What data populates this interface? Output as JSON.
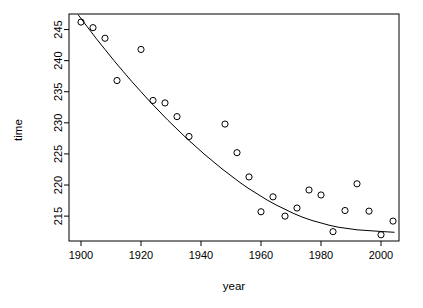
{
  "chart_data": {
    "type": "scatter",
    "title": "",
    "xlabel": "year",
    "ylabel": "time",
    "xlim": [
      1896.0,
      2006.0
    ],
    "ylim": [
      211.0,
      247.5
    ],
    "xticks": [
      1900,
      1920,
      1940,
      1960,
      1980,
      2000
    ],
    "yticks": [
      215,
      220,
      225,
      230,
      235,
      240,
      245
    ],
    "grid": false,
    "legend": null,
    "point_marker": "open-circle",
    "series": [
      {
        "name": "observed",
        "kind": "points",
        "x": [
          1900,
          1904,
          1908,
          1912,
          1920,
          1924,
          1928,
          1932,
          1936,
          1948,
          1952,
          1956,
          1960,
          1964,
          1968,
          1972,
          1976,
          1980,
          1984,
          1988,
          1992,
          1996,
          2000,
          2004
        ],
        "y": [
          246.2,
          245.3,
          243.6,
          236.8,
          241.8,
          233.6,
          233.2,
          231.0,
          227.8,
          229.8,
          225.2,
          221.3,
          215.7,
          218.1,
          215.0,
          216.3,
          219.2,
          218.4,
          212.5,
          215.9,
          220.2,
          215.8,
          212.0,
          214.2
        ]
      },
      {
        "name": "fitted-curve",
        "kind": "line",
        "x": [
          1899.0,
          1902.0,
          1905.0,
          1908.0,
          1911.0,
          1914.0,
          1917.0,
          1920.0,
          1923.0,
          1926.0,
          1929.0,
          1932.0,
          1935.0,
          1938.0,
          1941.0,
          1944.0,
          1947.0,
          1950.0,
          1953.0,
          1956.0,
          1959.0,
          1962.0,
          1965.0,
          1968.0,
          1971.0,
          1974.0,
          1977.0,
          1980.0,
          1983.0,
          1986.0,
          1989.0,
          1992.0,
          1995.0,
          1998.0,
          2001.0,
          2004.5
        ],
        "y": [
          247.4,
          245.5,
          243.6,
          241.8,
          240.0,
          238.3,
          236.6,
          235.0,
          233.4,
          231.9,
          230.4,
          229.0,
          227.6,
          226.3,
          225.0,
          223.8,
          222.6,
          221.5,
          220.4,
          219.4,
          218.5,
          217.6,
          216.8,
          216.1,
          215.4,
          214.8,
          214.3,
          213.9,
          213.5,
          213.2,
          213.0,
          212.8,
          212.7,
          212.6,
          212.5,
          212.4
        ]
      }
    ]
  },
  "plot": {
    "y_axis_label": "time",
    "x_axis_label": "year"
  }
}
